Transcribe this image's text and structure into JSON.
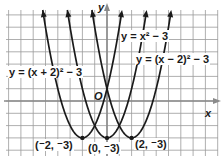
{
  "chart_data": {
    "type": "line",
    "title": "",
    "xlabel": "x",
    "ylabel": "y",
    "origin_label": "O",
    "xlim": [
      -8.5,
      9
    ],
    "ylim": [
      -4.5,
      8
    ],
    "grid": true,
    "series": [
      {
        "name": "y = (x + 2)² − 3",
        "h": -2,
        "k": -3,
        "vertex_label": "(⁻2, ⁻3)"
      },
      {
        "name": "y = x² − 3",
        "h": 0,
        "k": -3,
        "vertex_label": "(0, ⁻3)"
      },
      {
        "name": "y = (x − 2)² − 3",
        "h": 2,
        "k": -3,
        "vertex_label": "(2, ⁻3)"
      }
    ],
    "vertices": [
      [
        -2,
        -3
      ],
      [
        0,
        -3
      ],
      [
        2,
        -3
      ]
    ]
  },
  "labels": {
    "eq_left": "y = (x + 2)² − 3",
    "eq_mid": "y = x² − 3",
    "eq_right": "y = (x − 2)² − 3",
    "v_left": "(⁻2, ⁻3)",
    "v_mid": "(0, ⁻3)",
    "v_right": "(2, ⁻3)",
    "origin": "O",
    "x_axis": "x",
    "y_axis": "y"
  },
  "colors": {
    "grid": "#9a9a9a",
    "axis": "#8a8a8a",
    "curve": "#1a1a1a",
    "background": "#ffffff"
  }
}
